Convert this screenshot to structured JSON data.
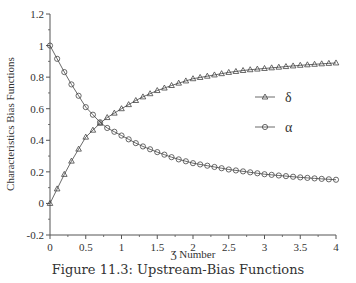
{
  "caption": "Figure 11.3: Upstream-Bias Functions",
  "chart_data": {
    "type": "line",
    "title": "",
    "xlabel": "Ʒ Number",
    "ylabel": "Characteristics Bias Functions",
    "xlim": [
      0,
      4
    ],
    "ylim": [
      -0.2,
      1.2
    ],
    "xticks": [
      "0",
      "0.5",
      "1",
      "1.5",
      "2",
      "2.5",
      "3",
      "3.5",
      "4"
    ],
    "yticks": [
      "-0.2",
      "0",
      "0.2",
      "0.4",
      "0.6",
      "0.8",
      "1",
      "1.2"
    ],
    "grid": false,
    "legend_position": "right-middle",
    "x": [
      0,
      0.25,
      0.5,
      0.75,
      1,
      1.25,
      1.5,
      1.75,
      2,
      2.25,
      2.5,
      2.75,
      3,
      3.25,
      3.5,
      3.75,
      4
    ],
    "series": [
      {
        "name": "δ",
        "marker": "triangle",
        "values": [
          0.0,
          0.23,
          0.42,
          0.53,
          0.6,
          0.665,
          0.715,
          0.755,
          0.79,
          0.81,
          0.83,
          0.845,
          0.855,
          0.865,
          0.875,
          0.883,
          0.89
        ]
      },
      {
        "name": "α",
        "marker": "circle",
        "values": [
          1.0,
          0.79,
          0.61,
          0.49,
          0.43,
          0.37,
          0.325,
          0.285,
          0.255,
          0.235,
          0.215,
          0.2,
          0.185,
          0.175,
          0.165,
          0.157,
          0.15
        ]
      }
    ]
  }
}
